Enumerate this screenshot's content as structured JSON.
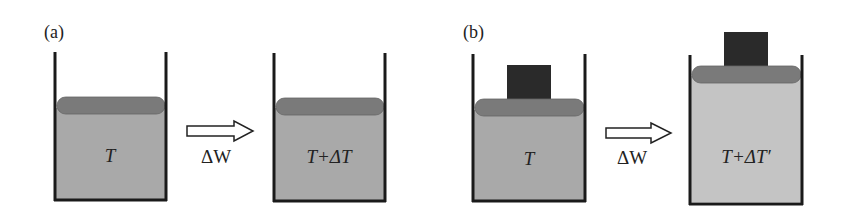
{
  "figure": {
    "panels": [
      {
        "label": "(a)",
        "before": {
          "text": "T",
          "has_weight": false
        },
        "process": {
          "label": "ΔW",
          "arrow": "hollow-right-arrow"
        },
        "after": {
          "text": "T+ΔT",
          "has_weight": false
        }
      },
      {
        "label": "(b)",
        "before": {
          "text": "T",
          "has_weight": true
        },
        "process": {
          "label": "ΔW",
          "arrow": "hollow-right-arrow"
        },
        "after": {
          "text": "T+ΔT′",
          "has_weight": true
        }
      }
    ],
    "colors": {
      "wall": "#1a1a1a",
      "gas_dark": "#a9a9a9",
      "gas_light": "#c4c4c4",
      "piston": "#7a7a7a",
      "weight": "#2a2a2a"
    }
  }
}
